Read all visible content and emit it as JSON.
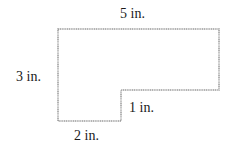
{
  "diagram": {
    "type": "l-shaped-polygon",
    "stroke_color": "#9a9a9a",
    "fill_color": "#ffffff",
    "text_color": "#1a1a1a",
    "labels": {
      "top": "5 in.",
      "left": "3 in.",
      "step": "1 in.",
      "bottom": "2 in."
    },
    "dimensions": {
      "top_width": 5,
      "left_height": 3,
      "step_height": 1,
      "bottom_width": 2,
      "unit": "in."
    }
  }
}
